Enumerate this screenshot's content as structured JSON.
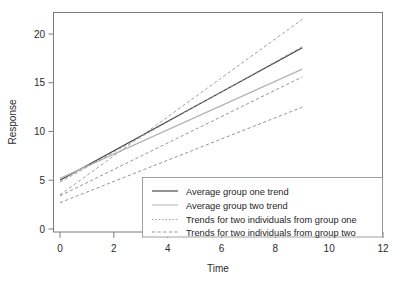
{
  "chart_data": {
    "type": "line",
    "title": "",
    "subtitle": "",
    "xlabel": "Time",
    "ylabel": "Response",
    "xlim": [
      0,
      12
    ],
    "ylim": [
      0,
      22
    ],
    "xticks": [
      0,
      2,
      4,
      6,
      8,
      10,
      12
    ],
    "yticks": [
      0,
      5,
      10,
      15,
      20
    ],
    "xtick_labels": [
      "0",
      "2",
      "4",
      "6",
      "8",
      "10",
      "12"
    ],
    "ytick_labels": [
      "0",
      "5",
      "10",
      "15",
      "20"
    ],
    "grid": false,
    "legend_position": "bottom-right",
    "x": [
      0,
      9
    ],
    "series": [
      {
        "name": "Average group one trend",
        "style": "solid",
        "color": "#3c3c3c",
        "width": 1.1,
        "values": [
          5.0,
          18.6
        ]
      },
      {
        "name": "Average group two trend",
        "style": "solid",
        "color": "#b4b4b4",
        "width": 1.3,
        "values": [
          5.2,
          16.4
        ]
      },
      {
        "name": "Trends for two individuals from group one (a)",
        "group": "Trends for two individuals from group one",
        "style": "dashed",
        "color": "#9a9a9a",
        "width": 0.95,
        "values": [
          3.5,
          21.5
        ]
      },
      {
        "name": "Trends for two individuals from group one (b)",
        "group": "Trends for two individuals from group one",
        "style": "dashed",
        "color": "#9a9a9a",
        "width": 0.95,
        "values": [
          4.8,
          18.7
        ]
      },
      {
        "name": "Trends for two individuals from group two (a)",
        "group": "Trends for two individuals from group two",
        "style": "dashed",
        "color": "#8e8e8e",
        "width": 0.95,
        "values": [
          3.4,
          15.6
        ]
      },
      {
        "name": "Trends for two individuals from group two (b)",
        "group": "Trends for two individuals from group two",
        "style": "dashed",
        "color": "#8e8e8e",
        "width": 0.95,
        "values": [
          2.7,
          12.5
        ]
      }
    ],
    "legend": [
      {
        "label": "Average group one trend",
        "style": "solid",
        "color": "#3c3c3c"
      },
      {
        "label": "Average group two trend",
        "style": "solid",
        "color": "#bcbcbc"
      },
      {
        "label": "Trends for two individuals from group one",
        "style": "dotted",
        "color": "#9a9a9a"
      },
      {
        "label": "Trends for two individuals from group two",
        "style": "dashed",
        "color": "#8e8e8e"
      }
    ]
  },
  "colors": {
    "background": "#ffffff",
    "frame": "#6e6e6e",
    "text": "#2b2b2b",
    "group_one": "#3c3c3c",
    "group_two": "#b4b4b4"
  }
}
